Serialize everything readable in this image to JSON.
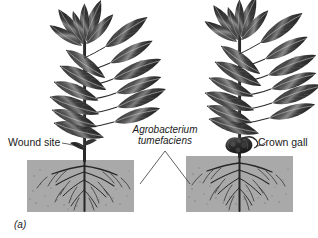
{
  "figure": {
    "panel_id": "(a)",
    "top_caption_fragment": "",
    "background_color": "#ffffff",
    "soil_color": "#a9a9a9",
    "ink_color": "#1a1a1a"
  },
  "labels": {
    "wound_site": "Wound site",
    "crown_gall": "Crown gall",
    "bacterium_line1": "Agrobacterium",
    "bacterium_line2": "tumefaciens"
  },
  "panels": [
    {
      "name": "healthy-plant-with-wound",
      "soil_box": {
        "x": 27,
        "y": 160,
        "width": 107,
        "height": 52
      },
      "has_gall": false
    },
    {
      "name": "infected-plant-with-crown-gall",
      "soil_box": {
        "x": 186,
        "y": 156,
        "width": 107,
        "height": 56
      },
      "has_gall": true
    }
  ],
  "icons": {
    "plant": "plant-icon",
    "root_system": "root-system-icon",
    "gall": "crown-gall-icon",
    "leader": "leader-line-icon"
  }
}
